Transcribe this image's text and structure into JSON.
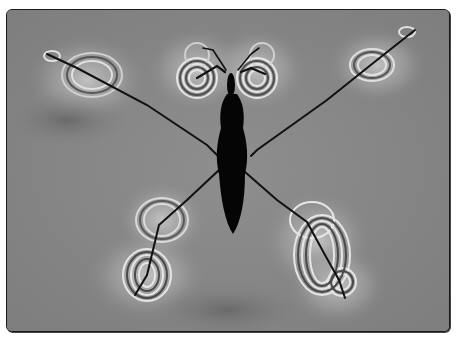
{
  "image": {
    "subject": "water-strider",
    "description": "Water strider standing on water surface with interference ripple patterns around leg contact points",
    "colors": {
      "background": "#8a8a8a",
      "silhouette": "#050505",
      "ripple_light": "#d8d8d8",
      "ripple_dark": "#5a5a5a",
      "border": "#1a1a1a"
    }
  }
}
